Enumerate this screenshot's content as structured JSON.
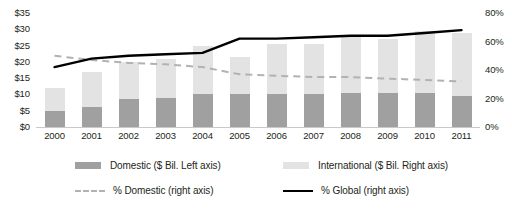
{
  "chart_data": {
    "type": "bar",
    "title": "",
    "subtitle": "",
    "xlabel": "",
    "ylabel": "",
    "categories": [
      "2000",
      "2001",
      "2002",
      "2003",
      "2004",
      "2005",
      "2006",
      "2007",
      "2008",
      "2009",
      "2010",
      "2011"
    ],
    "left_axis": {
      "label": "$ Bil.",
      "ticks": [
        "$0",
        "$5",
        "$10",
        "$15",
        "$20",
        "$25",
        "$30",
        "$35"
      ],
      "tick_values": [
        0,
        5,
        10,
        15,
        20,
        25,
        30,
        35
      ],
      "ylim": [
        0,
        35
      ]
    },
    "right_axis": {
      "label": "%",
      "ticks": [
        "0%",
        "20%",
        "40%",
        "60%",
        "80%"
      ],
      "tick_values": [
        0,
        20,
        40,
        60,
        80
      ],
      "ylim": [
        0,
        80
      ]
    },
    "grid": false,
    "legend_position": "bottom",
    "stacked": true,
    "series": [
      {
        "name": "Domestic ($ Bil. Left axis)",
        "short_name": "Domestic",
        "type": "bar",
        "axis": "left",
        "color": "#a0a0a0",
        "values": [
          5.0,
          6.0,
          8.5,
          9.0,
          10.0,
          10.0,
          10.0,
          10.0,
          10.5,
          10.5,
          10.5,
          9.5
        ]
      },
      {
        "name": "International ($ Bil. Right axis)",
        "short_name": "International",
        "type": "bar",
        "axis": "left",
        "color": "#e3e3e3",
        "values": [
          7.0,
          11.0,
          11.5,
          12.0,
          15.0,
          11.5,
          15.5,
          15.5,
          17.0,
          16.5,
          19.0,
          19.5
        ]
      },
      {
        "name": "% Domestic (right axis)",
        "short_name": "% Domestic",
        "type": "line",
        "axis": "right",
        "color": "#b2b2b2",
        "style": "dashed",
        "values": [
          50,
          47,
          45,
          44,
          42,
          37,
          36,
          35,
          35,
          34,
          33,
          32
        ]
      },
      {
        "name": "% Global (right axis)",
        "short_name": "% Global",
        "type": "line",
        "axis": "right",
        "color": "#000000",
        "style": "solid",
        "values": [
          42,
          48,
          50,
          51,
          52,
          62,
          62,
          63,
          64,
          64,
          66,
          68
        ]
      }
    ],
    "totals": [
      12.0,
      17.0,
      20.0,
      21.0,
      25.0,
      21.5,
      25.5,
      25.5,
      27.5,
      27.0,
      29.5,
      29.0
    ]
  },
  "legend": {
    "items": [
      {
        "label": "Domestic ($ Bil. Left axis)",
        "marker": "swatch",
        "color": "#a0a0a0"
      },
      {
        "label": "International ($ Bil. Right axis)",
        "marker": "swatch",
        "color": "#e3e3e3"
      },
      {
        "label": "% Domestic (right axis)",
        "marker": "dashed-line",
        "color": "#b2b2b2"
      },
      {
        "label": "% Global (right axis)",
        "marker": "solid-line",
        "color": "#000000"
      }
    ]
  }
}
